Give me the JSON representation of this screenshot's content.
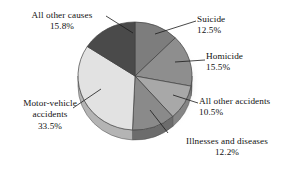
{
  "chart_data": {
    "type": "pie",
    "title": "",
    "subtitle": "",
    "xlabel": "",
    "ylabel": "",
    "legend_position": "none",
    "grid": false,
    "labels_as": "leader-line callouts",
    "style": "3D grayscale exploded-free pie with drop shadow",
    "start_angle_deg": 0,
    "direction": "clockwise",
    "categories": [
      "Suicide",
      "Homicide",
      "All other accidents",
      "Illnesses and diseases",
      "Motor-vehicle accidents",
      "All other causes"
    ],
    "values": [
      12.5,
      15.5,
      10.5,
      12.2,
      33.5,
      15.8
    ],
    "value_labels": [
      "12.5%",
      "15.5%",
      "10.5%",
      "12.2%",
      "33.5%",
      "15.8%"
    ],
    "units": "percent",
    "total": 100.0,
    "slices": [
      {
        "name": "Suicide",
        "value": 12.5,
        "value_label": "12.5%",
        "color": "#7d7d7d",
        "side_color": "#636363"
      },
      {
        "name": "Homicide",
        "value": 15.5,
        "value_label": "15.5%",
        "color": "#8e8e8e",
        "side_color": "#6f6f6f"
      },
      {
        "name": "All other accidents",
        "value": 10.5,
        "value_label": "10.5%",
        "color": "#a8a8a8",
        "side_color": "#858585"
      },
      {
        "name": "Illnesses and diseases",
        "value": 12.2,
        "value_label": "12.2%",
        "color": "#8a8a8a",
        "side_color": "#6c6c6c"
      },
      {
        "name": "Motor-vehicle accidents",
        "value": 33.5,
        "value_label": "33.5%",
        "color": "#e2e2e2",
        "side_color": "#b4b4b4"
      },
      {
        "name": "All other causes",
        "value": 15.8,
        "value_label": "15.8%",
        "color": "#4a4a4a",
        "side_color": "#3a3a3a"
      }
    ]
  },
  "labels": {
    "all_other_causes": {
      "name": "All other causes",
      "pct": "15.8%"
    },
    "suicide": {
      "name": "Suicide",
      "pct": "12.5%"
    },
    "homicide": {
      "name": "Homicide",
      "pct": "15.5%"
    },
    "all_other_accidents": {
      "name": "All other accidents",
      "pct": "10.5%"
    },
    "illnesses_and_diseases": {
      "name": "Illnesses and diseases",
      "pct": "12.2%"
    },
    "motor_vehicle_accidents": {
      "name": "Motor-vehicle",
      "name2": "accidents",
      "pct": "33.5%"
    }
  }
}
